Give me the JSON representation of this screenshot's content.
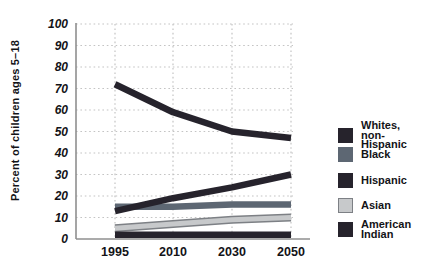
{
  "figure": {
    "y_axis_title": "Percent of children ages 5–18"
  },
  "chart_data": {
    "type": "line",
    "title": "",
    "xlabel": "",
    "ylabel": "Percent of children ages 5–18",
    "x_categories": [
      "1995",
      "2010",
      "2030",
      "2050"
    ],
    "ylim": [
      0,
      100
    ],
    "yticks": [
      0,
      10,
      20,
      30,
      40,
      50,
      60,
      70,
      80,
      90,
      100
    ],
    "grid": "dotted",
    "legend_position": "right",
    "colors": {
      "dark_navy": "#26232c",
      "slate_gray": "#5d6773",
      "light_gray": "#c7c9cb",
      "light_gray_outline": "#7d8085",
      "gridline": "#c4c4c4",
      "axis": "#8f8f8f",
      "text": "#131317"
    },
    "series": [
      {
        "name": "Whites, non-Hispanic",
        "legend_label": "Whites,\nnon-Hispanic",
        "color": "#26232c",
        "values": [
          72,
          59,
          50,
          47
        ]
      },
      {
        "name": "Black",
        "legend_label": "Black",
        "color": "#5d6773",
        "values": [
          15,
          15,
          16,
          16
        ]
      },
      {
        "name": "Hispanic",
        "legend_label": "Hispanic",
        "color": "#26232c",
        "values": [
          13,
          19,
          24,
          30
        ]
      },
      {
        "name": "Asian",
        "legend_label": "Asian",
        "color": "#c7c9cb",
        "outline": "#7d8085",
        "values": [
          5,
          7,
          9,
          10
        ]
      },
      {
        "name": "American Indian",
        "legend_label": "American\nIndian",
        "color": "#26232c",
        "values": [
          2,
          2,
          2,
          2
        ]
      }
    ]
  }
}
